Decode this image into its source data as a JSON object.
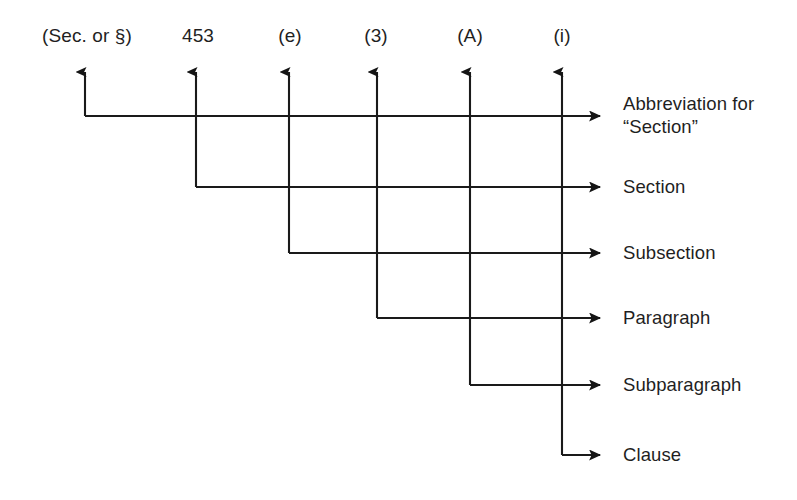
{
  "diagram": {
    "background_color": "#ffffff",
    "line_color": "#1a1a1a",
    "text_color": "#1f1f1f",
    "citation_tokens": [
      {
        "text": "(Sec. or §)",
        "x": 87,
        "label_key": "abbreviation"
      },
      {
        "text": "453",
        "x": 198,
        "label_key": "section"
      },
      {
        "text": "(e)",
        "x": 290,
        "label_key": "subsection"
      },
      {
        "text": "(3)",
        "x": 376,
        "label_key": "paragraph"
      },
      {
        "text": "(A)",
        "x": 470,
        "label_key": "subparagraph"
      },
      {
        "text": "(i)",
        "x": 562,
        "label_key": "clause"
      }
    ],
    "level_labels": [
      {
        "lines": [
          "Abbreviation for",
          "“Section”"
        ],
        "x": 623,
        "y": 92
      },
      {
        "lines": [
          "Section"
        ],
        "x": 623,
        "y": 175
      },
      {
        "lines": [
          "Subsection"
        ],
        "x": 623,
        "y": 241
      },
      {
        "lines": [
          "Paragraph"
        ],
        "x": 623,
        "y": 306
      },
      {
        "lines": [
          "Subparagraph"
        ],
        "x": 623,
        "y": 373
      },
      {
        "lines": [
          "Clause"
        ],
        "x": 623,
        "y": 443
      }
    ],
    "connectors": [
      {
        "name": "abbreviation-connector",
        "vx": 85,
        "vy_top": 72,
        "hy": 116,
        "hx_end": 600
      },
      {
        "name": "section-connector",
        "vx": 196,
        "vy_top": 72,
        "hy": 187,
        "hx_end": 600
      },
      {
        "name": "subsection-connector",
        "vx": 289,
        "vy_top": 72,
        "hy": 253,
        "hx_end": 600
      },
      {
        "name": "paragraph-connector",
        "vx": 377,
        "vy_top": 72,
        "hy": 318,
        "hx_end": 600
      },
      {
        "name": "subparagraph-connector",
        "vx": 470,
        "vy_top": 72,
        "hy": 385,
        "hx_end": 600
      },
      {
        "name": "clause-connector",
        "vx": 562,
        "vy_top": 72,
        "hy": 455,
        "hx_end": 600
      }
    ]
  }
}
